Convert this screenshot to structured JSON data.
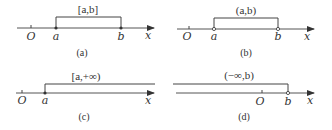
{
  "figure": {
    "panels": [
      {
        "id": "a",
        "caption": "(a)",
        "interval_label_parts": [
          "[",
          "a",
          ",",
          "b",
          "]"
        ],
        "interval_label": "[a,b]",
        "origin_label": "O",
        "axis_label": "x",
        "left_point_label": "a",
        "right_point_label": "b",
        "left_endpoint": "closed",
        "right_endpoint": "closed"
      },
      {
        "id": "b",
        "caption": "(b)",
        "interval_label": "(a,b)",
        "origin_label": "O",
        "axis_label": "x",
        "left_point_label": "a",
        "right_point_label": "b",
        "left_endpoint": "open",
        "right_endpoint": "open"
      },
      {
        "id": "c",
        "caption": "(c)",
        "interval_label": "[a,+∞)",
        "origin_label": "O",
        "axis_label": "x",
        "left_point_label": "a",
        "left_endpoint": "closed"
      },
      {
        "id": "d",
        "caption": "(d)",
        "interval_label": "(−∞,b)",
        "origin_label": "O",
        "axis_label": "x",
        "right_point_label": "b",
        "right_endpoint": "open"
      }
    ]
  }
}
